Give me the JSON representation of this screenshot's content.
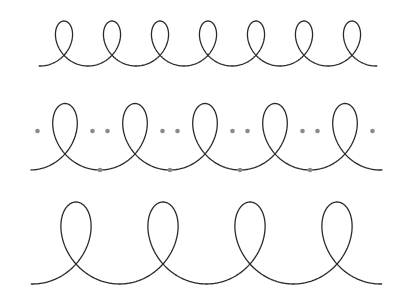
{
  "diagram": {
    "title": "",
    "curves": [
      {
        "name": "trochoid-row-1",
        "loops": 7,
        "markers": false,
        "stroke": "#2a2a2a"
      },
      {
        "name": "trochoid-row-2",
        "loops": 5,
        "markers": true,
        "stroke": "#2a2a2a",
        "marker_color": "#8a8a8a"
      },
      {
        "name": "trochoid-row-3",
        "loops": 4,
        "markers": false,
        "stroke": "#2a2a2a"
      }
    ]
  }
}
